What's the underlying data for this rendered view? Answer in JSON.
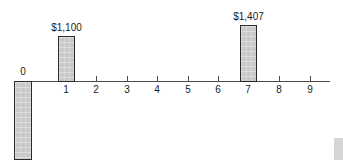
{
  "chart_data": {
    "type": "bar",
    "title": "",
    "subtitle": "",
    "xlabel": "",
    "ylabel": "",
    "grid": false,
    "legend_position": "none",
    "axis_orientation": "horizontal-timeline",
    "categories": [
      "0",
      "1",
      "2",
      "3",
      "4",
      "5",
      "6",
      "7",
      "8",
      "9"
    ],
    "tick_labels": [
      "0",
      "1",
      "2",
      "3",
      "4",
      "5",
      "6",
      "7",
      "8",
      "9"
    ],
    "xlim": [
      0,
      9
    ],
    "values": [
      -1100,
      1100,
      0,
      0,
      0,
      0,
      0,
      1407,
      0,
      0
    ],
    "data_labels": [
      "",
      "$1,100",
      "",
      "",
      "",
      "",
      "",
      "$1,407",
      "",
      ""
    ],
    "bars": [
      {
        "period": "0",
        "label": "",
        "direction": "down",
        "value": -1100,
        "clipped": true,
        "left_px": 14,
        "width_px": 18,
        "top_px": 81,
        "height_px": 79
      },
      {
        "period": "1",
        "label": "$1,100",
        "direction": "up",
        "value": 1100,
        "clipped": false,
        "left_px": 58,
        "width_px": 17,
        "top_px": 36,
        "height_px": 46
      },
      {
        "period": "7",
        "label": "$1,407",
        "direction": "up",
        "value": 1407,
        "clipped": false,
        "left_px": 240,
        "width_px": 17,
        "top_px": 25,
        "height_px": 57
      }
    ],
    "colors": {
      "bar_fill": "#c9c9c9",
      "bar_border": "#2b2b2b",
      "axis": "#4a4a4a",
      "text": "#1a1a1a",
      "background": "#ffffff"
    }
  },
  "ticks": [
    {
      "label": "0",
      "x": 23
    },
    {
      "label": "1",
      "x": 66
    },
    {
      "label": "2",
      "x": 96
    },
    {
      "label": "3",
      "x": 127
    },
    {
      "label": "4",
      "x": 157
    },
    {
      "label": "5",
      "x": 188
    },
    {
      "label": "6",
      "x": 218
    },
    {
      "label": "7",
      "x": 248
    },
    {
      "label": "8",
      "x": 279
    },
    {
      "label": "9",
      "x": 310
    }
  ],
  "zero_marker": {
    "label": "0"
  }
}
